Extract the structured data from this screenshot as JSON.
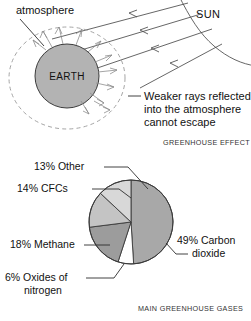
{
  "page": {
    "background_color": "#ffffff",
    "width": 251,
    "height": 321
  },
  "diagram_greenhouse": {
    "caption": "GREENHOUSE EFFECT",
    "labels": {
      "atmosphere": "atmosphere",
      "earth": "EARTH",
      "sun": "SUN",
      "reflected_line1": "Weaker rays reflected",
      "reflected_line2": "into the atmosphere",
      "reflected_line3": "cannot escape"
    },
    "colors": {
      "earth_fill": "#b3b3b3",
      "earth_stroke": "#3c3c3c",
      "atmosphere_stroke": "#9a9a9a",
      "incoming_ray": "#4a4a4a",
      "reflected_ray": "#8d8d8d",
      "sun_arc": "#4a4a4a"
    },
    "incoming_ray_count": 4,
    "reflected_ray_count": 11
  },
  "chart_data": {
    "type": "pie",
    "title": "MAIN GREENHOUSE GASES",
    "unit": "%",
    "total": 100,
    "legend_position": "around-slices",
    "grid": false,
    "categories": [
      "Carbon dioxide",
      "Oxides of nitrogen",
      "Methane",
      "CFCs",
      "Other"
    ],
    "values": [
      49,
      6,
      18,
      14,
      13
    ],
    "slices": [
      {
        "label_line1": "49% Carbon",
        "label_line2": "dioxide",
        "label_full": "49% Carbon dioxide",
        "name": "Carbon dioxide",
        "value": 49,
        "start_angle": 0,
        "end_angle": 176.4,
        "color": "#a8a8a8"
      },
      {
        "label_line1": "6% Oxides of",
        "label_line2": "nitrogen",
        "label_full": "6% Oxides of nitrogen",
        "name": "Oxides of nitrogen",
        "value": 6,
        "start_angle": 176.4,
        "end_angle": 198.0,
        "color": "#ffffff"
      },
      {
        "label_line1": "18% Methane",
        "label_line2": "",
        "label_full": "18% Methane",
        "name": "Methane",
        "value": 18,
        "start_angle": 198.0,
        "end_angle": 262.8,
        "color": "#9c9c9c"
      },
      {
        "label_line1": "14% CFCs",
        "label_line2": "",
        "label_full": "14% CFCs",
        "name": "CFCs",
        "value": 14,
        "start_angle": 262.8,
        "end_angle": 313.2,
        "color": "#c4c4c4"
      },
      {
        "label_line1": "13% Other",
        "label_line2": "",
        "label_full": "13% Other",
        "name": "Other",
        "value": 13,
        "start_angle": 313.2,
        "end_angle": 360,
        "color": "#d8d8d8"
      }
    ]
  }
}
